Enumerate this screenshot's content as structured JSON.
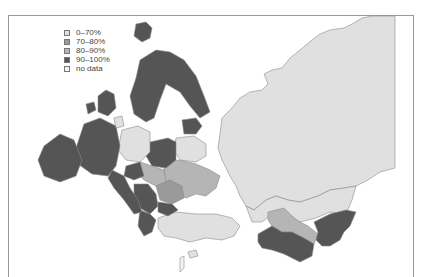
{
  "map": {
    "title": "",
    "region": "Europe and Central Asia",
    "legend": [
      {
        "label": "0–70%",
        "color": "#e0e0e0"
      },
      {
        "label": "70–80%",
        "color": "#9a9a9a"
      },
      {
        "label": "80–90%",
        "color": "#b5b5b5"
      },
      {
        "label": "90–100%",
        "color": "#555555"
      },
      {
        "label": "no data",
        "color": "#f4f4f4"
      }
    ],
    "colors": {
      "c0_70": "#e0e0e0",
      "c70_80": "#9a9a9a",
      "c80_90": "#b5b5b5",
      "c90_100": "#555555",
      "nodata": "#f4f4f4",
      "border": "#8a8a8a",
      "frame": "#9a9a9a"
    }
  }
}
